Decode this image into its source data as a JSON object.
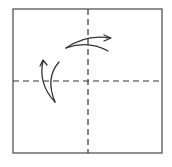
{
  "diagram": {
    "type": "origami-fold-diagram",
    "canvas": {
      "width": 172,
      "height": 167,
      "background": "#ffffff"
    },
    "paper": {
      "x": 13,
      "y": 9,
      "width": 149,
      "height": 144,
      "stroke": "#555555",
      "stroke_width": 1.3
    },
    "fold_lines": [
      {
        "name": "vertical-valley-fold",
        "orientation": "vertical",
        "position": 88,
        "style": "dashed",
        "dash": "6,4",
        "stroke": "#333333"
      },
      {
        "name": "horizontal-valley-fold",
        "orientation": "horizontal",
        "position": 81,
        "style": "dashed",
        "dash": "6,4",
        "stroke": "#333333"
      }
    ],
    "arrows": [
      {
        "name": "top-fold-arrow",
        "direction": "right",
        "outer_path": "M66,48 Q86,34 110,38",
        "inner_path": "M66,48 Q88,40 108,51",
        "head": "M104,35 L111,38 L104,41"
      },
      {
        "name": "left-fold-arrow",
        "direction": "up",
        "outer_path": "M55,102 Q38,84 43,61",
        "inner_path": "M55,102 Q45,78 59,62",
        "head": "M40,66 L43,60 L47,65"
      }
    ],
    "color": "#333333"
  }
}
